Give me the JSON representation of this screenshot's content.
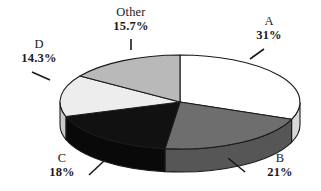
{
  "chart_data": {
    "type": "pie",
    "title": "",
    "subtitle": "",
    "xlabel": "",
    "ylabel": "",
    "legend_position": "none",
    "grid": false,
    "three_d": true,
    "start_angle_deg": 0,
    "direction": "clockwise",
    "categories": [
      "A",
      "B",
      "C",
      "D",
      "Other"
    ],
    "values": [
      31,
      21,
      18,
      14.3,
      15.7
    ],
    "labels": [
      "31%",
      "21%",
      "18%",
      "14.3%",
      "15.7%"
    ],
    "colors": [
      "#ffffff",
      "#6e6e6e",
      "#111111",
      "#ededed",
      "#b9b9b9"
    ],
    "side_colors": [
      "#d8d8d8",
      "#565656",
      "#090909",
      "#c9c9c9",
      "#9d9d9d"
    ],
    "slices": [
      {
        "name": "A",
        "value": 31,
        "label": "31%",
        "top_color": "#ffffff",
        "side_color": "#d8d8d8"
      },
      {
        "name": "B",
        "value": 21,
        "label": "21%",
        "top_color": "#6e6e6e",
        "side_color": "#565656"
      },
      {
        "name": "C",
        "value": 18,
        "label": "18%",
        "top_color": "#111111",
        "side_color": "#090909"
      },
      {
        "name": "D",
        "value": 14.3,
        "label": "14.3%",
        "top_color": "#ededed",
        "side_color": "#c9c9c9"
      },
      {
        "name": "Other",
        "value": 15.7,
        "label": "15.7%",
        "top_color": "#b9b9b9",
        "side_color": "#9d9d9d"
      }
    ]
  },
  "callouts": {
    "other": {
      "category": "Other",
      "percent": "15.7%"
    },
    "a": {
      "category": "A",
      "percent": "31%"
    },
    "d": {
      "category": "D",
      "percent": "14.3%"
    },
    "c": {
      "category": "C",
      "percent": "18%"
    },
    "b": {
      "category": "B",
      "percent": "21%"
    }
  }
}
